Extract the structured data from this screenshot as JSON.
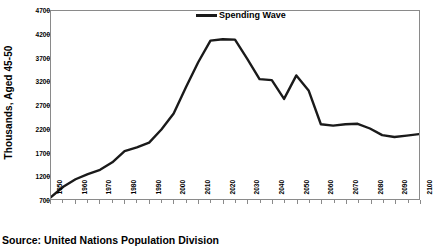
{
  "chart_data": {
    "type": "line",
    "title": "",
    "subtitle": "",
    "xlabel": "",
    "ylabel": "Thousands, Aged 45-50",
    "xlim": [
      1950,
      2100
    ],
    "ylim": [
      700,
      4700
    ],
    "ytick_step": 500,
    "xtick_step": 10,
    "grid": false,
    "legend_position": "top-center",
    "line_color": "#1a1a1a",
    "axis_color": "#8a8a8a",
    "yticks": [
      "4700",
      "4200",
      "3700",
      "3200",
      "2700",
      "2200",
      "1700",
      "1200",
      "700"
    ],
    "ytick_values": [
      4700,
      4200,
      3700,
      3200,
      2700,
      2200,
      1700,
      1200,
      700
    ],
    "xticks": [
      "1950",
      "1960",
      "1970",
      "1980",
      "1990",
      "2000",
      "2010",
      "2020",
      "2030",
      "2040",
      "2050",
      "2060",
      "2070",
      "2080",
      "2090",
      "2100"
    ],
    "xtick_values": [
      1950,
      1960,
      1970,
      1980,
      1990,
      2000,
      2010,
      2020,
      2030,
      2040,
      2050,
      2060,
      2070,
      2080,
      2090,
      2100
    ],
    "series": [
      {
        "name": "Spending Wave",
        "x": [
          1950,
          1955,
          1960,
          1965,
          1970,
          1975,
          1980,
          1985,
          1990,
          1995,
          2000,
          2005,
          2010,
          2015,
          2020,
          2025,
          2030,
          2035,
          2040,
          2045,
          2050,
          2055,
          2060,
          2065,
          2070,
          2075,
          2080,
          2085,
          2090,
          2095,
          2100
        ],
        "values": [
          740,
          960,
          1120,
          1230,
          1320,
          1480,
          1720,
          1800,
          1900,
          2180,
          2520,
          3080,
          3610,
          4070,
          4100,
          4090,
          3680,
          3250,
          3230,
          2830,
          3330,
          3010,
          2290,
          2260,
          2290,
          2300,
          2200,
          2060,
          2020,
          2050,
          2080
        ]
      }
    ],
    "legend": [
      {
        "label": "Spending Wave",
        "color": "#1a1a1a"
      }
    ],
    "annotations": []
  },
  "legend": {
    "spending_wave_label": "Spending Wave"
  },
  "axes": {
    "y_title": "Thousands, Aged 45-50"
  },
  "caption": {
    "source": "Source: United Nations Population Division"
  }
}
